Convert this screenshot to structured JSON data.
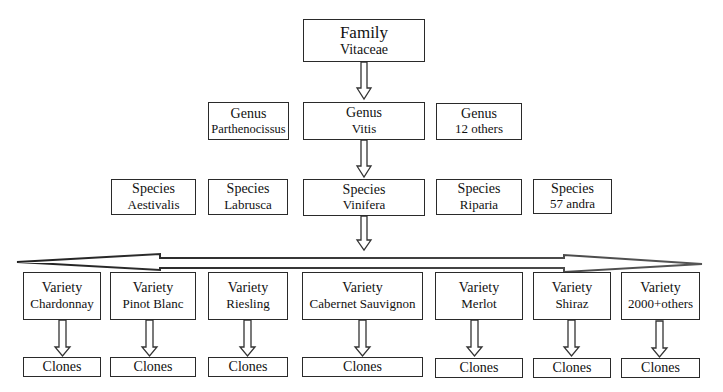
{
  "family": {
    "rank": "Family",
    "name": "Vitaceae"
  },
  "genera": [
    {
      "rank": "Genus",
      "name": "Parthenocissus"
    },
    {
      "rank": "Genus",
      "name": "Vitis"
    },
    {
      "rank": "Genus",
      "name": "12 others"
    }
  ],
  "species": [
    {
      "rank": "Species",
      "name": "Aestivalis"
    },
    {
      "rank": "Species",
      "name": "Labrusca"
    },
    {
      "rank": "Species",
      "name": "Vinifera"
    },
    {
      "rank": "Species",
      "name": "Riparia"
    },
    {
      "rank": "Species",
      "name": "57 andra"
    }
  ],
  "varieties": [
    {
      "rank": "Variety",
      "name": "Chardonnay",
      "clone": "Clones"
    },
    {
      "rank": "Variety",
      "name": "Pinot Blanc",
      "clone": "Clones"
    },
    {
      "rank": "Variety",
      "name": "Riesling",
      "clone": "Clones"
    },
    {
      "rank": "Variety",
      "name": "Cabernet Sauvignon",
      "clone": "Clones"
    },
    {
      "rank": "Variety",
      "name": "Merlot",
      "clone": "Clones"
    },
    {
      "rank": "Variety",
      "name": "Shiraz",
      "clone": "Clones"
    },
    {
      "rank": "Variety",
      "name": "2000+others",
      "clone": "Clones"
    }
  ],
  "colors": {
    "border": "#2a2a2a",
    "background": "#ffffff",
    "text": "#111111"
  }
}
